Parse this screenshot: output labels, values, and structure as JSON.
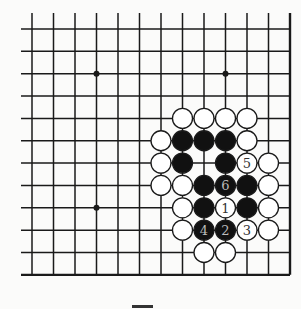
{
  "diagram": {
    "type": "go-board-fragment",
    "colors": {
      "background": "#fbfbfa",
      "line": "#1a1a1a",
      "black_stone": "#111111",
      "white_stone": "#ffffff",
      "black_label": "#bbbbbb",
      "white_label": "#333333"
    },
    "grid": {
      "x0": 32,
      "x_step": 21.5,
      "cols": 13,
      "y0": 29,
      "y_step": 22.35,
      "rows": 12,
      "open_top_extend_to": 13,
      "open_left_extend_to": 21,
      "edge_right": true,
      "edge_bottom": true
    },
    "star_points": [
      {
        "col": 3,
        "row": 2
      },
      {
        "col": 9,
        "row": 2
      },
      {
        "col": 3,
        "row": 8
      }
    ],
    "stones": [
      {
        "col": 7,
        "row": 4,
        "color": "white",
        "label": ""
      },
      {
        "col": 8,
        "row": 4,
        "color": "white",
        "label": ""
      },
      {
        "col": 9,
        "row": 4,
        "color": "white",
        "label": ""
      },
      {
        "col": 10,
        "row": 4,
        "color": "white",
        "label": ""
      },
      {
        "col": 6,
        "row": 5,
        "color": "white",
        "label": ""
      },
      {
        "col": 7,
        "row": 5,
        "color": "black",
        "label": ""
      },
      {
        "col": 8,
        "row": 5,
        "color": "black",
        "label": ""
      },
      {
        "col": 9,
        "row": 5,
        "color": "black",
        "label": ""
      },
      {
        "col": 10,
        "row": 5,
        "color": "white",
        "label": ""
      },
      {
        "col": 6,
        "row": 6,
        "color": "white",
        "label": ""
      },
      {
        "col": 7,
        "row": 6,
        "color": "black",
        "label": ""
      },
      {
        "col": 9,
        "row": 6,
        "color": "black",
        "label": ""
      },
      {
        "col": 10,
        "row": 6,
        "color": "white",
        "label": "5"
      },
      {
        "col": 11,
        "row": 6,
        "color": "white",
        "label": ""
      },
      {
        "col": 6,
        "row": 7,
        "color": "white",
        "label": ""
      },
      {
        "col": 7,
        "row": 7,
        "color": "white",
        "label": ""
      },
      {
        "col": 8,
        "row": 7,
        "color": "black",
        "label": ""
      },
      {
        "col": 9,
        "row": 7,
        "color": "black",
        "label": "6"
      },
      {
        "col": 10,
        "row": 7,
        "color": "black",
        "label": ""
      },
      {
        "col": 11,
        "row": 7,
        "color": "white",
        "label": ""
      },
      {
        "col": 7,
        "row": 8,
        "color": "white",
        "label": ""
      },
      {
        "col": 8,
        "row": 8,
        "color": "black",
        "label": ""
      },
      {
        "col": 9,
        "row": 8,
        "color": "white",
        "label": "1"
      },
      {
        "col": 10,
        "row": 8,
        "color": "black",
        "label": ""
      },
      {
        "col": 11,
        "row": 8,
        "color": "white",
        "label": ""
      },
      {
        "col": 7,
        "row": 9,
        "color": "white",
        "label": ""
      },
      {
        "col": 8,
        "row": 9,
        "color": "black",
        "label": "4"
      },
      {
        "col": 9,
        "row": 9,
        "color": "black",
        "label": "2"
      },
      {
        "col": 10,
        "row": 9,
        "color": "white",
        "label": "3"
      },
      {
        "col": 11,
        "row": 9,
        "color": "white",
        "label": ""
      },
      {
        "col": 8,
        "row": 10,
        "color": "white",
        "label": ""
      },
      {
        "col": 9,
        "row": 10,
        "color": "white",
        "label": ""
      }
    ],
    "move_labels": [
      "1",
      "2",
      "3",
      "4",
      "5",
      "6"
    ]
  }
}
